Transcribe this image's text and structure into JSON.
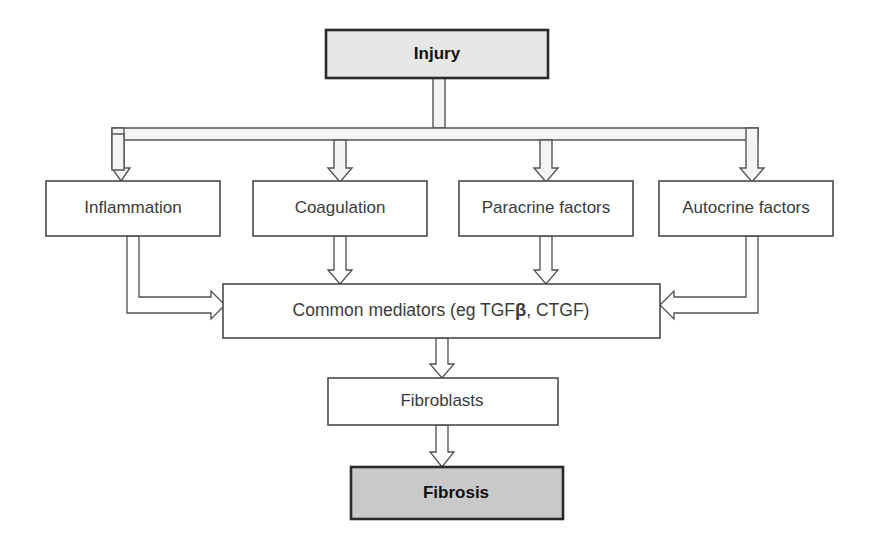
{
  "figure": {
    "kind": "flowchart",
    "background_color": "#ffffff",
    "default_box_fill": "#ffffff",
    "default_box_stroke": "#4a4a4a",
    "highlight_light_fill": "#e7e7e7",
    "highlight_dark_fill": "#c9c9c9",
    "connector_fill": "#f4f4f4",
    "connector_stroke": "#555555",
    "text_color": "#3b3b3b"
  },
  "nodes": {
    "injury": {
      "label": "Injury",
      "style": "shaded-light",
      "emphasis": "bold",
      "level": 1
    },
    "inflammation": {
      "label": "Inflammation",
      "style": "plain",
      "level": 2
    },
    "coagulation": {
      "label": "Coagulation",
      "style": "plain",
      "level": 2
    },
    "paracrine": {
      "label": "Paracrine factors",
      "style": "plain",
      "level": 2
    },
    "autocrine": {
      "label": "Autocrine factors",
      "style": "plain",
      "level": 2
    },
    "mediators": {
      "label_prefix": "Common mediators (eg TGF",
      "label_greek": "β",
      "label_suffix": ", CTGF)",
      "label_full": "Common mediators (eg TGFβ, CTGF)",
      "style": "plain",
      "level": 3
    },
    "fibroblasts": {
      "label": "Fibroblasts",
      "style": "plain",
      "level": 4
    },
    "fibrosis": {
      "label": "Fibrosis",
      "style": "shaded-dark",
      "emphasis": "bold",
      "level": 5
    }
  },
  "edges": [
    {
      "from": "injury",
      "to": "inflammation",
      "arrow": "down",
      "routing": "bus"
    },
    {
      "from": "injury",
      "to": "coagulation",
      "arrow": "down",
      "routing": "bus"
    },
    {
      "from": "injury",
      "to": "paracrine",
      "arrow": "down",
      "routing": "bus"
    },
    {
      "from": "injury",
      "to": "autocrine",
      "arrow": "down",
      "routing": "bus"
    },
    {
      "from": "inflammation",
      "to": "mediators",
      "arrow": "right",
      "routing": "elbow-left"
    },
    {
      "from": "coagulation",
      "to": "mediators",
      "arrow": "down",
      "routing": "straight"
    },
    {
      "from": "paracrine",
      "to": "mediators",
      "arrow": "down",
      "routing": "straight"
    },
    {
      "from": "autocrine",
      "to": "mediators",
      "arrow": "left",
      "routing": "elbow-right"
    },
    {
      "from": "mediators",
      "to": "fibroblasts",
      "arrow": "down",
      "routing": "straight"
    },
    {
      "from": "fibroblasts",
      "to": "fibrosis",
      "arrow": "down",
      "routing": "straight"
    }
  ]
}
